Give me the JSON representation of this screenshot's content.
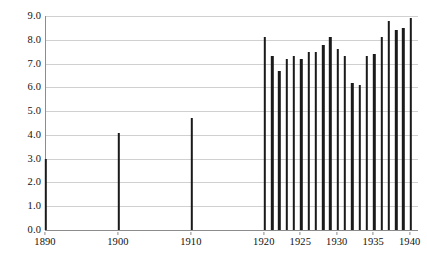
{
  "chart_data": {
    "type": "bar",
    "title": "",
    "subtitle": "",
    "xlabel": "",
    "ylabel": "",
    "xlim": [
      1890,
      1941
    ],
    "ylim": [
      0.0,
      9.0
    ],
    "grid": true,
    "legend": null,
    "y_ticks": [
      "0.0",
      "1.0",
      "2.0",
      "3.0",
      "4.0",
      "5.0",
      "6.0",
      "7.0",
      "8.0",
      "9.0"
    ],
    "y_tick_values": [
      0.0,
      1.0,
      2.0,
      3.0,
      4.0,
      5.0,
      6.0,
      7.0,
      8.0,
      9.0
    ],
    "x_ticks": [
      "1890",
      "1900",
      "1910",
      "1920",
      "1925",
      "1930",
      "1935",
      "1940"
    ],
    "x_tick_values": [
      1890,
      1900,
      1910,
      1920,
      1925,
      1930,
      1935,
      1940
    ],
    "categories": [
      1890,
      1900,
      1910,
      1920,
      1921,
      1922,
      1923,
      1924,
      1925,
      1926,
      1927,
      1928,
      1929,
      1930,
      1931,
      1932,
      1933,
      1934,
      1935,
      1936,
      1937,
      1938,
      1939,
      1940
    ],
    "values": [
      3.0,
      4.1,
      4.7,
      8.1,
      7.3,
      6.7,
      7.2,
      7.3,
      7.2,
      7.5,
      7.5,
      7.8,
      8.1,
      7.6,
      7.3,
      6.2,
      6.1,
      7.3,
      7.4,
      8.1,
      8.8,
      8.4,
      8.5,
      8.9
    ],
    "bar_color": "#1a1a1a",
    "grid_color": "#d0d0d0",
    "axis_color": "#8c8c8c",
    "background": "#ffffff"
  }
}
